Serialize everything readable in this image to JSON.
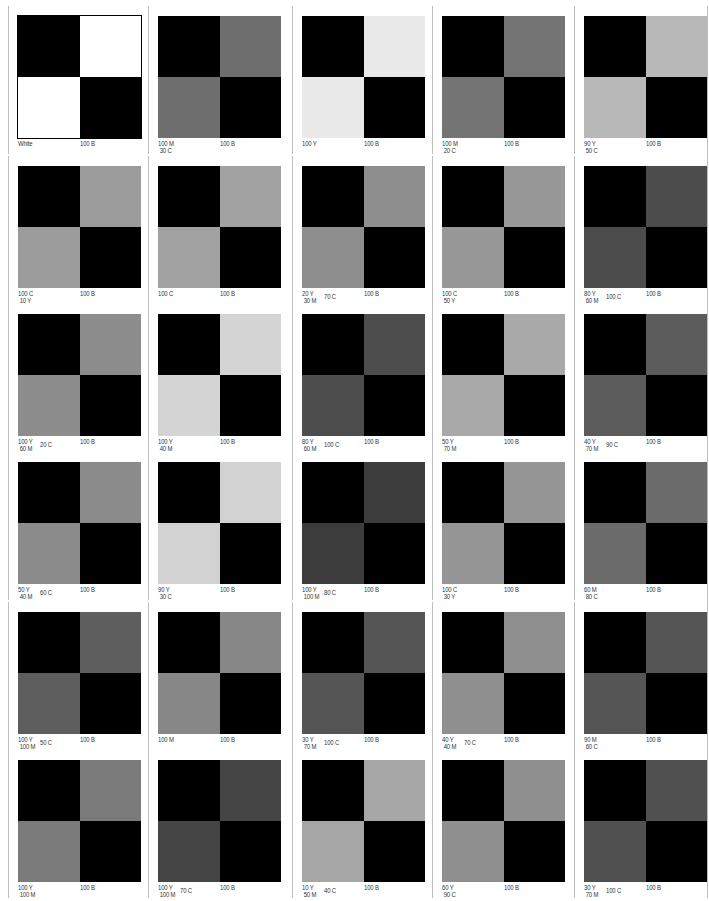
{
  "page": {
    "columns": 5,
    "rows": 6,
    "black_label": "100 B",
    "tiles": [
      {
        "lines": [
          "White"
        ],
        "mid": "",
        "b": "100 B",
        "gray": "#ffffff"
      },
      {
        "lines": [
          "100 M",
          "30 C"
        ],
        "mid": "",
        "b": "100 B",
        "gray": "#6e6e6e"
      },
      {
        "lines": [
          "100 Y"
        ],
        "mid": "",
        "b": "100 B",
        "gray": "#e9e9e9"
      },
      {
        "lines": [
          "100 M",
          "20 C"
        ],
        "mid": "",
        "b": "100 B",
        "gray": "#747474"
      },
      {
        "lines": [
          "90 Y",
          "50 C"
        ],
        "mid": "",
        "b": "100 B",
        "gray": "#b8b8b8"
      },
      {
        "lines": [
          "100 C",
          "10 Y"
        ],
        "mid": "",
        "b": "100 B",
        "gray": "#9b9b9b"
      },
      {
        "lines": [
          "100 C"
        ],
        "mid": "",
        "b": "100 B",
        "gray": "#a2a2a2"
      },
      {
        "lines": [
          "20 Y",
          "30 M"
        ],
        "mid": "70 C",
        "b": "100 B",
        "gray": "#8e8e8e"
      },
      {
        "lines": [
          "100 C",
          "50 Y"
        ],
        "mid": "",
        "b": "100 B",
        "gray": "#989898"
      },
      {
        "lines": [
          "80 Y",
          "60 M"
        ],
        "mid": "100 C",
        "b": "100 B",
        "gray": "#4c4c4c"
      },
      {
        "lines": [
          "100 Y",
          "60 M"
        ],
        "mid": "20 C",
        "b": "100 B",
        "gray": "#8d8d8d"
      },
      {
        "lines": [
          "100 Y",
          "40 M"
        ],
        "mid": "",
        "b": "100 B",
        "gray": "#d4d4d4"
      },
      {
        "lines": [
          "80 Y",
          "60 M"
        ],
        "mid": "100 C",
        "b": "100 B",
        "gray": "#4d4d4d"
      },
      {
        "lines": [
          "50 Y",
          "70 M"
        ],
        "mid": "",
        "b": "100 B",
        "gray": "#a9a9a9"
      },
      {
        "lines": [
          "40 Y",
          "70 M"
        ],
        "mid": "90 C",
        "b": "100 B",
        "gray": "#5c5c5c"
      },
      {
        "lines": [
          "50 Y",
          "40 M"
        ],
        "mid": "60 C",
        "b": "100 B",
        "gray": "#8b8b8b"
      },
      {
        "lines": [
          "90 Y",
          "30 C"
        ],
        "mid": "",
        "b": "100 B",
        "gray": "#d2d2d2"
      },
      {
        "lines": [
          "100 Y",
          "100 M"
        ],
        "mid": "80 C",
        "b": "100 B",
        "gray": "#3c3c3c"
      },
      {
        "lines": [
          "100 C",
          "30 Y"
        ],
        "mid": "",
        "b": "100 B",
        "gray": "#959595"
      },
      {
        "lines": [
          "60 M",
          "80 C"
        ],
        "mid": "",
        "b": "100 B",
        "gray": "#6b6b6b"
      },
      {
        "lines": [
          "100 Y",
          "100 M"
        ],
        "mid": "50 C",
        "b": "100 B",
        "gray": "#5e5e5e"
      },
      {
        "lines": [
          "100 M"
        ],
        "mid": "",
        "b": "100 B",
        "gray": "#878787"
      },
      {
        "lines": [
          "30 Y",
          "70 M"
        ],
        "mid": "100 C",
        "b": "100 B",
        "gray": "#555555"
      },
      {
        "lines": [
          "40 Y",
          "40 M"
        ],
        "mid": "70 C",
        "b": "100 B",
        "gray": "#8f8f8f"
      },
      {
        "lines": [
          "90 M",
          "60 C"
        ],
        "mid": "",
        "b": "100 B",
        "gray": "#555555"
      },
      {
        "lines": [
          "100 Y",
          "100 M"
        ],
        "mid": "",
        "b": "100 B",
        "gray": "#7a7a7a"
      },
      {
        "lines": [
          "100 Y",
          "100 M"
        ],
        "mid": "70 C",
        "b": "100 B",
        "gray": "#454545"
      },
      {
        "lines": [
          "10 Y",
          "50 M"
        ],
        "mid": "40 C",
        "b": "100 B",
        "gray": "#a6a6a6"
      },
      {
        "lines": [
          "60 Y",
          "90 C"
        ],
        "mid": "",
        "b": "100 B",
        "gray": "#8f8f8f"
      },
      {
        "lines": [
          "30 Y",
          "70 M"
        ],
        "mid": "100 C",
        "b": "100 B",
        "gray": "#505050"
      }
    ]
  }
}
